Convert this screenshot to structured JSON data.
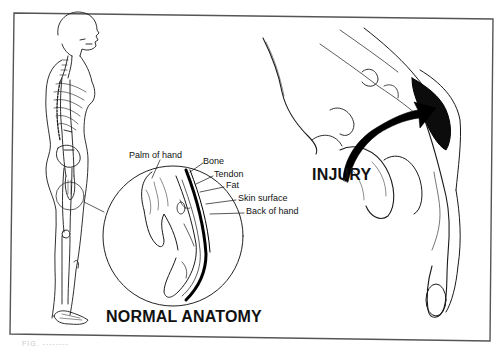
{
  "figure": {
    "frame_color": "#555555",
    "ink_color": "#111111",
    "background": "#ffffff"
  },
  "panels": {
    "normal": {
      "title": "NORMAL ANATOMY",
      "callouts": [
        {
          "label": "Palm of hand"
        },
        {
          "label": "Bone"
        },
        {
          "label": "Tendon"
        },
        {
          "label": "Fat"
        },
        {
          "label": "Skin surface"
        },
        {
          "label": "Back of hand"
        }
      ]
    },
    "injury": {
      "title": "INJURY",
      "arrow_icon": "curved-arrow-icon"
    }
  },
  "caption": "FIG. --------"
}
